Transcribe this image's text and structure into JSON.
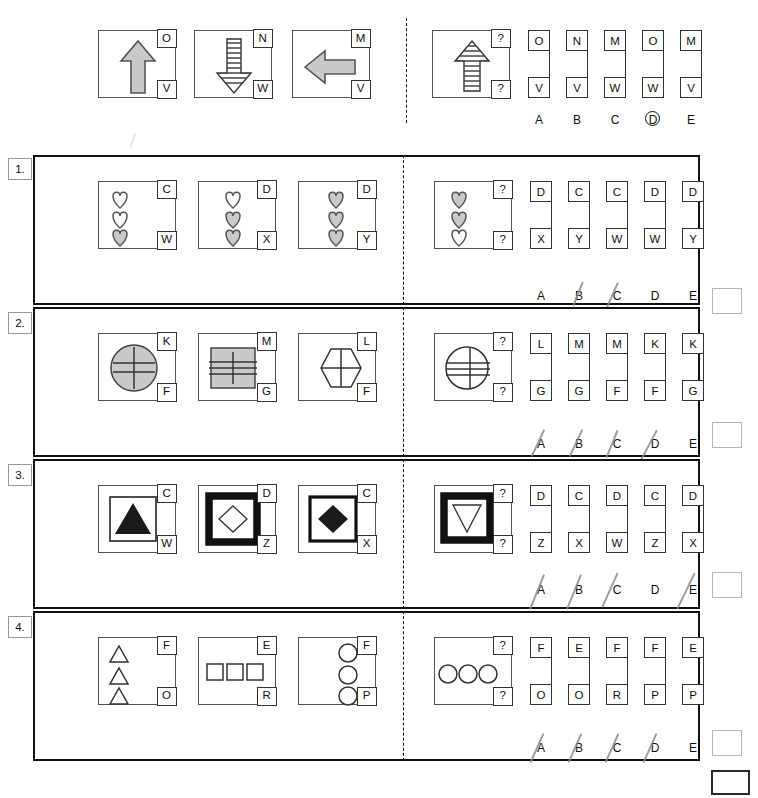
{
  "sheet": {
    "title": "Figure-series multiple-choice answer sheet",
    "question_mark": "?",
    "option_letters": [
      "A",
      "B",
      "C",
      "D",
      "E"
    ]
  },
  "example_row": {
    "number_label": "",
    "stem": [
      {
        "shape": "arrow-up-solid-gray",
        "top": "O",
        "bottom": "V"
      },
      {
        "shape": "arrow-down-striped",
        "top": "N",
        "bottom": "W"
      },
      {
        "shape": "arrow-left-solid-gray",
        "top": "M",
        "bottom": "V"
      }
    ],
    "question": {
      "shape": "arrow-up-striped",
      "top": "?",
      "bottom": "?"
    },
    "options": [
      {
        "letter": "A",
        "top": "O",
        "bottom": "V",
        "struck": false,
        "circled": false
      },
      {
        "letter": "B",
        "top": "N",
        "bottom": "V",
        "struck": false,
        "circled": false
      },
      {
        "letter": "C",
        "top": "M",
        "bottom": "W",
        "struck": false,
        "circled": false
      },
      {
        "letter": "D",
        "top": "O",
        "bottom": "W",
        "struck": false,
        "circled": true
      },
      {
        "letter": "E",
        "top": "M",
        "bottom": "V",
        "struck": false,
        "circled": false
      }
    ]
  },
  "rows": [
    {
      "number_label": "1.",
      "stem": [
        {
          "shape": "hearts-3-left",
          "top": "C",
          "bottom": "W"
        },
        {
          "shape": "hearts-3-center",
          "top": "D",
          "bottom": "X"
        },
        {
          "shape": "hearts-3-right",
          "top": "D",
          "bottom": "Y"
        }
      ],
      "question": {
        "shape": "hearts-3-left-q",
        "top": "?",
        "bottom": "?"
      },
      "options": [
        {
          "letter": "A",
          "top": "D",
          "bottom": "X",
          "struck": false
        },
        {
          "letter": "B",
          "top": "C",
          "bottom": "Y",
          "struck": true
        },
        {
          "letter": "C",
          "top": "C",
          "bottom": "W",
          "struck": true
        },
        {
          "letter": "D",
          "top": "D",
          "bottom": "W",
          "struck": false
        },
        {
          "letter": "E",
          "top": "D",
          "bottom": "Y",
          "struck": false
        }
      ],
      "answer_box": ""
    },
    {
      "number_label": "2.",
      "stem": [
        {
          "shape": "circle-gray-crosslines",
          "top": "K",
          "bottom": "F"
        },
        {
          "shape": "square-gray-lines",
          "top": "M",
          "bottom": "G"
        },
        {
          "shape": "hexagon-cross",
          "top": "L",
          "bottom": "F"
        }
      ],
      "question": {
        "shape": "circle-white-lines",
        "top": "?",
        "bottom": "?"
      },
      "options": [
        {
          "letter": "A",
          "top": "L",
          "bottom": "G",
          "struck": true
        },
        {
          "letter": "B",
          "top": "M",
          "bottom": "G",
          "struck": true
        },
        {
          "letter": "C",
          "top": "M",
          "bottom": "F",
          "struck": true
        },
        {
          "letter": "D",
          "top": "K",
          "bottom": "F",
          "struck": true
        },
        {
          "letter": "E",
          "top": "K",
          "bottom": "G",
          "struck": false
        }
      ],
      "answer_box": ""
    },
    {
      "number_label": "3.",
      "stem": [
        {
          "shape": "triangle-black-thin-frame",
          "top": "C",
          "bottom": "W"
        },
        {
          "shape": "diamond-white-thick-frame",
          "top": "D",
          "bottom": "Z"
        },
        {
          "shape": "diamond-black-medium-frame",
          "top": "C",
          "bottom": "X"
        }
      ],
      "question": {
        "shape": "triangle-down-white-thick-frame",
        "top": "?",
        "bottom": "?"
      },
      "options": [
        {
          "letter": "A",
          "top": "D",
          "bottom": "Z",
          "struck": true
        },
        {
          "letter": "B",
          "top": "C",
          "bottom": "X",
          "struck": true
        },
        {
          "letter": "C",
          "top": "D",
          "bottom": "W",
          "struck": true
        },
        {
          "letter": "D",
          "top": "C",
          "bottom": "Z",
          "struck": false
        },
        {
          "letter": "E",
          "top": "D",
          "bottom": "X",
          "struck": true
        }
      ],
      "answer_box": ""
    },
    {
      "number_label": "4.",
      "stem": [
        {
          "shape": "triangles-3-vertical-left",
          "top": "F",
          "bottom": "O"
        },
        {
          "shape": "squares-3-horizontal",
          "top": "E",
          "bottom": "R"
        },
        {
          "shape": "circles-3-vertical-right",
          "top": "F",
          "bottom": "P"
        }
      ],
      "question": {
        "shape": "circles-3-horizontal",
        "top": "?",
        "bottom": "?"
      },
      "options": [
        {
          "letter": "A",
          "top": "F",
          "bottom": "O",
          "struck": true
        },
        {
          "letter": "B",
          "top": "E",
          "bottom": "O",
          "struck": true
        },
        {
          "letter": "C",
          "top": "F",
          "bottom": "R",
          "struck": true
        },
        {
          "letter": "D",
          "top": "F",
          "bottom": "P",
          "struck": true
        },
        {
          "letter": "E",
          "top": "E",
          "bottom": "P",
          "struck": false
        }
      ],
      "answer_box": ""
    }
  ],
  "footer": {
    "final_box": ""
  },
  "colors": {
    "ink": "#111111",
    "shape_gray": "#c9c9c9",
    "frame": "#555555",
    "answer_border": "#b6b6b6",
    "pencil": "#8d8d8d"
  }
}
